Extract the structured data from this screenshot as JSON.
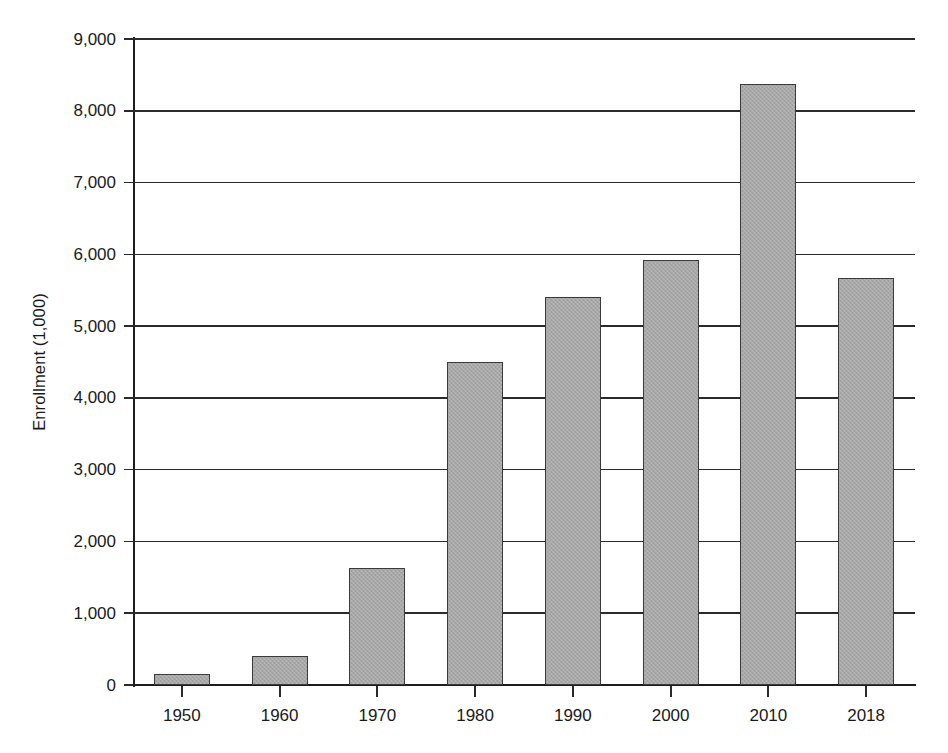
{
  "chart_data": {
    "type": "bar",
    "title": "",
    "subtitle": "",
    "xlabel": "",
    "ylabel": "Enrollment (1,000)",
    "categories": [
      "1950",
      "1960",
      "1970",
      "1980",
      "1990",
      "2000",
      "2010",
      "2018"
    ],
    "values": [
      150,
      400,
      1630,
      4500,
      5400,
      5920,
      8380,
      5670
    ],
    "series": [
      {
        "name": "Enrollment",
        "values": [
          150,
          400,
          1630,
          4500,
          5400,
          5920,
          8380,
          5670
        ]
      }
    ],
    "ylim": [
      0,
      9000
    ],
    "y_ticks": [
      0,
      1000,
      2000,
      3000,
      4000,
      5000,
      6000,
      7000,
      8000,
      9000
    ],
    "y_tick_labels": [
      "0",
      "1,000",
      "2,000",
      "3,000",
      "4,000",
      "5,000",
      "6,000",
      "7,000",
      "8,000",
      "9,000"
    ],
    "x_tick_labels": [
      "1950",
      "1960",
      "1970",
      "1980",
      "1990",
      "2000",
      "2010",
      "2018"
    ],
    "grid": true,
    "grid_axis": "y",
    "legend": false,
    "legend_position": "none",
    "annotations": [],
    "colors": {
      "bar_fill": "#a8a8a8",
      "bar_edge": "#3a3a3a",
      "axis": "#1d1d1d",
      "grid": "#2a2a2a",
      "text": "#1a1a1a",
      "background": "#ffffff"
    }
  }
}
